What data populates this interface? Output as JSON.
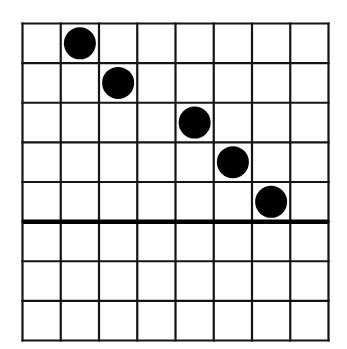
{
  "grid": {
    "columns": 8,
    "rows": 8,
    "left": 22.5,
    "top": 23.5,
    "width": 306,
    "height": 317,
    "line_color": "#141414",
    "line_width": 2.2,
    "thick_line_after_row": 5,
    "thick_line_width": 4.5
  },
  "pieces": [
    {
      "col": 1,
      "row": 0,
      "color": "#000000"
    },
    {
      "col": 2,
      "row": 1,
      "color": "#000000"
    },
    {
      "col": 4,
      "row": 2,
      "color": "#000000"
    },
    {
      "col": 5,
      "row": 3,
      "color": "#000000"
    },
    {
      "col": 6,
      "row": 4,
      "color": "#000000"
    }
  ],
  "piece_radius": 16
}
